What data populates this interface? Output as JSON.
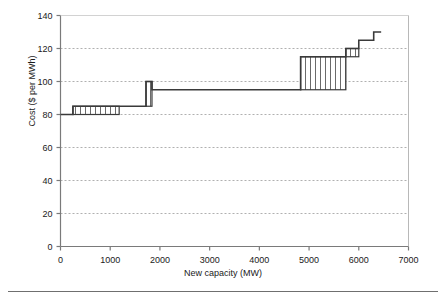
{
  "figure": {
    "background": "#ffffff",
    "axis_color": "#808080",
    "grid_color": "#b0b0b0",
    "curve_color": "#3a3a3a",
    "hatch_color": "#555555"
  },
  "chart_data": {
    "type": "line",
    "title": "",
    "xlabel": "New capacity (MW)",
    "ylabel": "Cost ($ per MWh)",
    "xlim": [
      0,
      7000
    ],
    "ylim": [
      0,
      140
    ],
    "xticks": [
      0,
      1000,
      2000,
      3000,
      4000,
      5000,
      6000,
      7000
    ],
    "yticks": [
      0,
      20,
      40,
      60,
      80,
      100,
      120,
      140
    ],
    "xtick_labels": [
      "0",
      "1000",
      "2000",
      "3000",
      "4000",
      "5000",
      "6000",
      "7000"
    ],
    "ytick_labels": [
      "0",
      "20",
      "40",
      "60",
      "80",
      "100",
      "120",
      "140"
    ],
    "grid": "horizontal-dashed",
    "legend": "none",
    "series": [
      {
        "name": "Supply cost curve",
        "style": "step",
        "steps": [
          {
            "x_start": 0,
            "x_end": 250,
            "y": 80,
            "hatched": false
          },
          {
            "x_start": 250,
            "x_end": 1180,
            "y": 85,
            "hatched": true
          },
          {
            "x_start": 1180,
            "x_end": 1720,
            "y": 85,
            "hatched": false
          },
          {
            "x_start": 1720,
            "x_end": 1840,
            "y": 100,
            "hatched": true
          },
          {
            "x_start": 1840,
            "x_end": 4830,
            "y": 95,
            "hatched": false
          },
          {
            "x_start": 4830,
            "x_end": 5740,
            "y": 115,
            "hatched": true
          },
          {
            "x_start": 5740,
            "x_end": 6000,
            "y": 120,
            "hatched": true
          },
          {
            "x_start": 6000,
            "x_end": 6300,
            "y": 125,
            "hatched": false
          },
          {
            "x_start": 6300,
            "x_end": 6450,
            "y": 130,
            "hatched": false
          }
        ]
      }
    ]
  }
}
